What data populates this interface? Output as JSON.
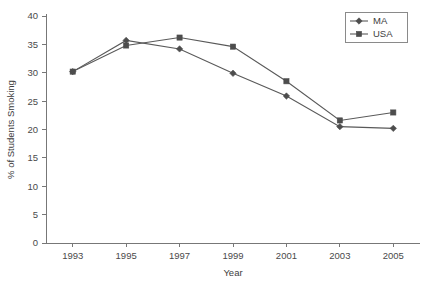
{
  "chart_data": {
    "type": "line",
    "title": "",
    "xlabel": "Year",
    "ylabel": "% of Students Smoking",
    "categories": [
      1993,
      1995,
      1997,
      1999,
      2001,
      2003,
      2005
    ],
    "x_tick_labels": [
      "1993",
      "1995",
      "1997",
      "1999",
      "2001",
      "2003",
      "2005"
    ],
    "y_tick_labels": [
      "0",
      "5",
      "10",
      "15",
      "20",
      "25",
      "30",
      "35",
      "40"
    ],
    "y_ticks": [
      0,
      5,
      10,
      15,
      20,
      25,
      30,
      35,
      40
    ],
    "xlim": [
      1992,
      2006
    ],
    "ylim": [
      0,
      40
    ],
    "grid": false,
    "legend_position": "top-right",
    "series": [
      {
        "name": "MA",
        "marker": "diamond",
        "color": "#4d4d4d",
        "values": [
          30.2,
          35.7,
          34.2,
          29.9,
          25.9,
          20.5,
          20.2
        ]
      },
      {
        "name": "USA",
        "marker": "square",
        "color": "#4d4d4d",
        "values": [
          30.2,
          34.8,
          36.2,
          34.6,
          28.5,
          21.6,
          23.0
        ]
      }
    ]
  },
  "legend": {
    "entries": [
      {
        "label": "MA"
      },
      {
        "label": "USA"
      }
    ]
  },
  "axes": {
    "x_title": "Year",
    "y_title": "% of Students Smoking"
  }
}
